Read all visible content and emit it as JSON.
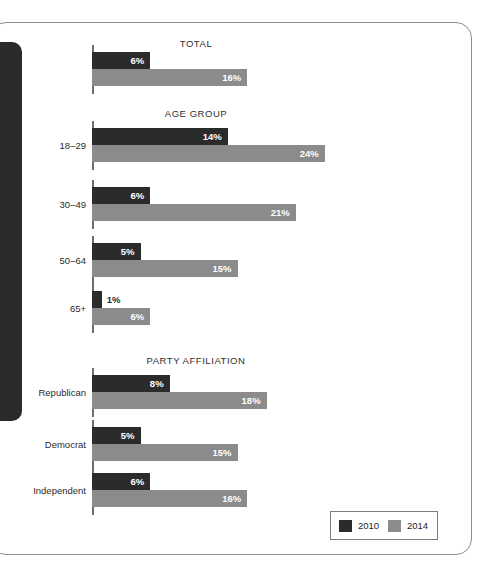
{
  "chart_data": {
    "type": "bar",
    "orientation": "horizontal",
    "title": "",
    "xlabel": "",
    "ylabel": "",
    "xlim": [
      0,
      26
    ],
    "grid": false,
    "value_suffix": "%",
    "legend_position": "bottom-right",
    "legend": [
      {
        "name": "2010",
        "color": "#2b2b2b"
      },
      {
        "name": "2014",
        "color": "#8b8b8b"
      }
    ],
    "series": [
      {
        "name": "2010",
        "color": "#2b2b2b",
        "values": [
          6,
          14,
          6,
          5,
          1,
          8,
          5,
          6
        ]
      },
      {
        "name": "2014",
        "color": "#8b8b8b",
        "values": [
          16,
          24,
          21,
          15,
          6,
          18,
          15,
          16
        ]
      }
    ],
    "categories": [
      "",
      "18–29",
      "30–49",
      "50–64",
      "65+",
      "Republican",
      "Democrat",
      "Independent"
    ],
    "sections": [
      {
        "title": "TOTAL",
        "groups": [
          {
            "label": "",
            "bars": [
              {
                "series": "2010",
                "value": 6,
                "label": "6%"
              },
              {
                "series": "2014",
                "value": 16,
                "label": "16%"
              }
            ]
          }
        ]
      },
      {
        "title": "AGE GROUP",
        "groups": [
          {
            "label": "18–29",
            "bars": [
              {
                "series": "2010",
                "value": 14,
                "label": "14%"
              },
              {
                "series": "2014",
                "value": 24,
                "label": "24%"
              }
            ]
          },
          {
            "label": "30–49",
            "bars": [
              {
                "series": "2010",
                "value": 6,
                "label": "6%"
              },
              {
                "series": "2014",
                "value": 21,
                "label": "21%"
              }
            ]
          },
          {
            "label": "50–64",
            "bars": [
              {
                "series": "2010",
                "value": 5,
                "label": "5%"
              },
              {
                "series": "2014",
                "value": 15,
                "label": "15%"
              }
            ]
          },
          {
            "label": "65+",
            "bars": [
              {
                "series": "2010",
                "value": 1,
                "label": "1%"
              },
              {
                "series": "2014",
                "value": 6,
                "label": "6%"
              }
            ]
          }
        ]
      },
      {
        "title": "PARTY AFFILIATION",
        "groups": [
          {
            "label": "Republican",
            "bars": [
              {
                "series": "2010",
                "value": 8,
                "label": "8%"
              },
              {
                "series": "2014",
                "value": 18,
                "label": "18%"
              }
            ]
          },
          {
            "label": "Democrat",
            "bars": [
              {
                "series": "2010",
                "value": 5,
                "label": "5%"
              },
              {
                "series": "2014",
                "value": 15,
                "label": "15%"
              }
            ]
          },
          {
            "label": "Independent",
            "bars": [
              {
                "series": "2010",
                "value": 6,
                "label": "6%"
              },
              {
                "series": "2014",
                "value": 16,
                "label": "16%"
              }
            ]
          }
        ]
      }
    ]
  },
  "layout": {
    "axis_x": 92,
    "px_per_unit": 9.7,
    "bar_height": 17,
    "section_title_center_x": 196,
    "label_right_x": 86,
    "sections": [
      {
        "title_y": 38,
        "group_tops": [
          52
        ]
      },
      {
        "title_y": 108,
        "group_tops": [
          128,
          187,
          243,
          291
        ]
      },
      {
        "title_y": 355,
        "group_tops": [
          375,
          427,
          473
        ]
      }
    ]
  }
}
